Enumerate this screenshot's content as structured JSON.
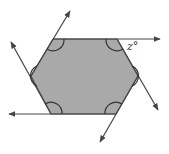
{
  "diagram": {
    "shape": "hexagon",
    "fill_color": "#a9a9a9",
    "stroke_color": "#444444",
    "vertices": [
      [
        53,
        39
      ],
      [
        117,
        39
      ],
      [
        138,
        76
      ],
      [
        116,
        114
      ],
      [
        51,
        114
      ],
      [
        31,
        76
      ]
    ],
    "angle_label": "z°",
    "extended_lines": 6,
    "interior_angle_marks": 6
  }
}
